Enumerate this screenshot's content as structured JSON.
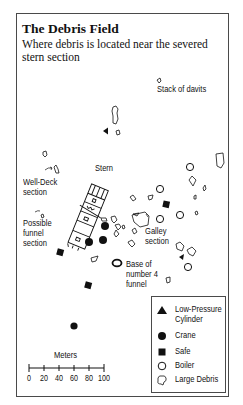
{
  "title": "The Debris Field",
  "subtitle": "Where debris is located near the severed stern section",
  "labels": {
    "stack_of_davits": "Stack of davits",
    "stern": "Stern",
    "well_deck": "Well-Deck\nsection",
    "possible_funnel": "Possible\nfunnel\nsection",
    "galley": "Galley\nsection",
    "base_funnel": "Base of\nnumber 4\nfunnel"
  },
  "legend": {
    "items": [
      {
        "symbol": "filled-triangle",
        "label": "Low-Pressure\nCylinder"
      },
      {
        "symbol": "filled-circle",
        "label": "Crane"
      },
      {
        "symbol": "filled-square",
        "label": "Safe"
      },
      {
        "symbol": "open-circle",
        "label": "Boiler"
      },
      {
        "symbol": "debris-outline",
        "label": "Large Debris"
      }
    ]
  },
  "scale": {
    "title": "Meters",
    "ticks": [
      "0",
      "20",
      "40",
      "60",
      "80",
      "100"
    ]
  },
  "colors": {
    "ink": "#111111",
    "frame": "#4a4a4a",
    "background": "#ffffff"
  }
}
